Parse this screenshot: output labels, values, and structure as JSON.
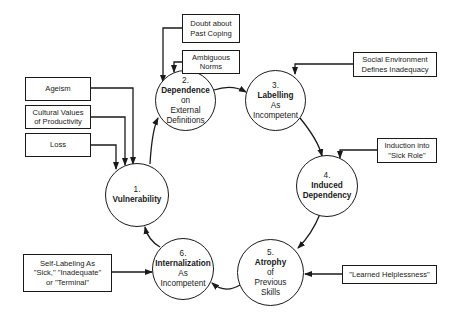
{
  "stages": [
    {
      "number": "1.",
      "title": "Vulnerability",
      "rest": ""
    },
    {
      "number": "2.",
      "title": "Dependence",
      "rest": "on\nExternal\nDefinitions"
    },
    {
      "number": "3.",
      "title": "Labelling",
      "rest": "As\nIncompetent"
    },
    {
      "number": "4.",
      "title": "Induced\nDependency",
      "rest": ""
    },
    {
      "number": "5.",
      "title": "Atrophy",
      "rest": "of\nPrevious\nSkills"
    },
    {
      "number": "6.",
      "title": "Internalization",
      "rest": "As\nIncompetent"
    }
  ],
  "inputs": {
    "ageism": "Ageism",
    "cultural_values": "Cultural Values\nof Productivity",
    "loss": "Loss",
    "doubt": "Doubt about\nPast Coping",
    "ambiguous_norms": "Ambiguous\nNorms",
    "social_environment": "Social Environment\nDefines Inadequacy",
    "induction": "Induction into\n\"Sick Role\"",
    "learned_helplessness": "\"Learned Helplessness\"",
    "self_labeling": "Self-Labeling As\n\"Sick,\" \"Inadequate\"\nor \"Terminal\""
  }
}
